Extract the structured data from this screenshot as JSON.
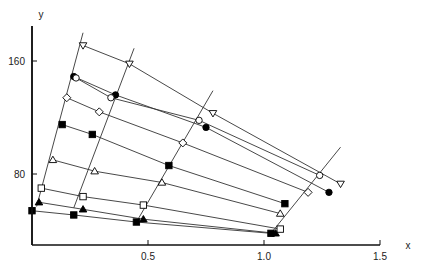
{
  "chart_data": {
    "type": "scatter",
    "title": "",
    "xlabel": "x",
    "ylabel": "y",
    "xlim": [
      0,
      1.5
    ],
    "ylim": [
      30,
      185
    ],
    "xticks": [
      0.5,
      1.0,
      1.5
    ],
    "xtick_labels": [
      "0.5",
      "1.0",
      "1.5"
    ],
    "yticks": [
      80,
      160
    ],
    "ytick_labels": [
      "80",
      "160"
    ],
    "grid": false,
    "legend": null,
    "series": [
      {
        "name": "open-down-triangle",
        "marker": "tri-down-open",
        "x": [
          0.22,
          0.42,
          0.78,
          1.33
        ],
        "y": [
          171,
          158,
          123,
          73
        ]
      },
      {
        "name": "filled-circle",
        "marker": "circle-filled",
        "x": [
          0.18,
          0.36,
          0.75,
          1.28
        ],
        "y": [
          149,
          136,
          113,
          67
        ]
      },
      {
        "name": "open-circle",
        "marker": "circle-open",
        "x": [
          0.19,
          0.34,
          0.72,
          1.24
        ],
        "y": [
          148,
          134,
          118,
          79
        ]
      },
      {
        "name": "open-diamond",
        "marker": "diamond-open",
        "x": [
          0.15,
          0.29,
          0.65,
          1.19
        ],
        "y": [
          134,
          124,
          102,
          67
        ]
      },
      {
        "name": "filled-square",
        "marker": "square-filled",
        "x": [
          0.13,
          0.26,
          0.59,
          1.09
        ],
        "y": [
          115,
          108,
          86,
          59
        ]
      },
      {
        "name": "open-up-triangle",
        "marker": "tri-up-open",
        "x": [
          0.09,
          0.27,
          0.56,
          1.07
        ],
        "y": [
          90,
          82,
          74,
          52
        ]
      },
      {
        "name": "open-square",
        "marker": "square-open",
        "x": [
          0.04,
          0.22,
          0.48,
          1.07
        ],
        "y": [
          70,
          64,
          58,
          41
        ]
      },
      {
        "name": "filled-up-triangle",
        "marker": "tri-up-filled",
        "x": [
          0.03,
          0.22,
          0.48,
          1.05
        ],
        "y": [
          60,
          55,
          48,
          38
        ]
      },
      {
        "name": "filled-square-bottom",
        "marker": "square-filled",
        "x": [
          0.0,
          0.18,
          0.45,
          1.03
        ],
        "y": [
          54,
          51,
          46,
          38
        ]
      }
    ],
    "iso_lines": [
      {
        "x": [
          0.02,
          0.22
        ],
        "y": [
          57,
          180
        ]
      },
      {
        "x": [
          0.18,
          0.44
        ],
        "y": [
          56,
          169
        ]
      },
      {
        "name": "third",
        "x": [
          0.45,
          0.78
        ],
        "y": [
          46,
          139
        ]
      },
      {
        "x": [
          1.03,
          1.33
        ],
        "y": [
          38,
          99
        ]
      }
    ]
  }
}
